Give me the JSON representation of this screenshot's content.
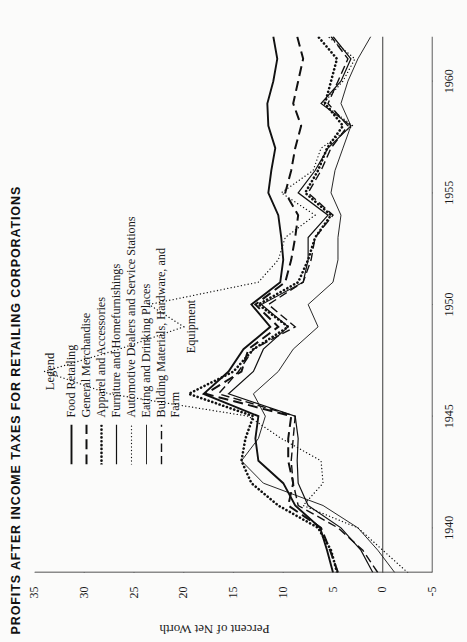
{
  "title": "PROFITS AFTER INCOME TAXES FOR RETAILING CORPORATIONS",
  "legend": {
    "heading": "Legend",
    "continuation": "Equipment"
  },
  "axes": {
    "ylabel": "Percent of Net Worth",
    "xlabel": ""
  },
  "chart_data": {
    "type": "line",
    "title": "PROFITS AFTER INCOME TAXES FOR RETAILING CORPORATIONS",
    "xlabel": "",
    "ylabel": "Percent of Net Worth",
    "xlim": [
      1938,
      1962
    ],
    "ylim": [
      -5,
      35
    ],
    "yticks": [
      35,
      30,
      25,
      20,
      15,
      10,
      5,
      0,
      -5
    ],
    "xticks": [
      1940,
      1945,
      1950,
      1955,
      1960
    ],
    "grid": false,
    "legend_position": "top-center-inside",
    "x": [
      1938,
      1939,
      1940,
      1941,
      1942,
      1943,
      1944,
      1945,
      1946,
      1947,
      1948,
      1949,
      1950,
      1951,
      1952,
      1953,
      1954,
      1955,
      1956,
      1957,
      1958,
      1959,
      1960,
      1961,
      1962
    ],
    "series": [
      {
        "name": "Food Retailing",
        "style": "solid",
        "color": "#111111",
        "width": 1.9,
        "values": [
          5.0,
          5.6,
          6.3,
          8.8,
          10.0,
          12.5,
          12.8,
          12.5,
          18.0,
          15.5,
          14.0,
          11.3,
          13.2,
          10.3,
          10.0,
          10.2,
          10.5,
          11.5,
          11.2,
          10.8,
          11.5,
          11.6,
          11.0,
          10.6,
          11.0
        ]
      },
      {
        "name": "General Merchandise",
        "style": "longdash",
        "color": "#111111",
        "width": 2.0,
        "values": [
          4.5,
          5.3,
          6.2,
          9.5,
          9.0,
          9.5,
          9.5,
          9.2,
          17.8,
          14.2,
          13.5,
          10.5,
          12.8,
          9.8,
          9.2,
          8.8,
          8.5,
          9.8,
          9.2,
          8.8,
          8.2,
          9.0,
          8.5,
          8.0,
          8.6
        ]
      },
      {
        "name": "Apparel and Accessories",
        "style": "thickdot",
        "color": "#111111",
        "width": 2.6,
        "values": [
          4.6,
          5.2,
          6.5,
          10.5,
          13.2,
          14.2,
          13.8,
          13.0,
          19.5,
          15.0,
          13.0,
          9.5,
          12.5,
          8.5,
          7.5,
          6.8,
          5.2,
          7.8,
          6.5,
          5.6,
          4.0,
          5.8,
          5.2,
          4.6,
          6.5
        ]
      },
      {
        "name": "Furniture and Homefurnishings",
        "style": "solid",
        "color": "#111111",
        "width": 1.2,
        "values": [
          1.0,
          2.2,
          4.2,
          7.5,
          8.5,
          8.6,
          8.5,
          8.8,
          15.5,
          13.0,
          12.0,
          9.5,
          12.2,
          8.0,
          7.5,
          7.5,
          5.5,
          8.5,
          6.8,
          5.5,
          3.2,
          6.2,
          4.2,
          3.2,
          5.0
        ]
      },
      {
        "name": "Automotive Dealers and Service Stations",
        "style": "finedot",
        "color": "#111111",
        "width": 1.3,
        "values": [
          -2.5,
          0.0,
          2.5,
          8.0,
          6.0,
          6.2,
          10.2,
          13.5,
          27.5,
          34.0,
          26.5,
          20.0,
          23.5,
          12.5,
          10.5,
          9.8,
          6.8,
          10.2,
          7.0,
          6.2,
          3.0,
          6.0,
          4.0,
          2.8,
          5.5
        ]
      },
      {
        "name": "Eating and Drinking Places",
        "style": "solid",
        "color": "#111111",
        "width": 0.9,
        "values": [
          -1.2,
          0.5,
          2.5,
          6.0,
          12.0,
          14.2,
          12.5,
          11.8,
          13.0,
          10.5,
          9.0,
          6.5,
          7.5,
          5.0,
          4.5,
          4.5,
          4.2,
          5.2,
          4.8,
          4.0,
          3.2,
          4.2,
          3.5,
          2.5,
          1.2
        ]
      },
      {
        "name": "Building Materials, Hardware, and Farm Equipment",
        "style": "dashdot",
        "color": "#111111",
        "width": 1.4,
        "values": [
          0.5,
          2.0,
          4.5,
          8.5,
          9.0,
          9.2,
          9.0,
          8.8,
          16.5,
          14.5,
          13.0,
          8.8,
          11.5,
          8.0,
          7.2,
          6.8,
          5.0,
          7.5,
          6.2,
          5.2,
          3.5,
          5.5,
          4.5,
          3.5,
          5.2
        ]
      }
    ]
  }
}
